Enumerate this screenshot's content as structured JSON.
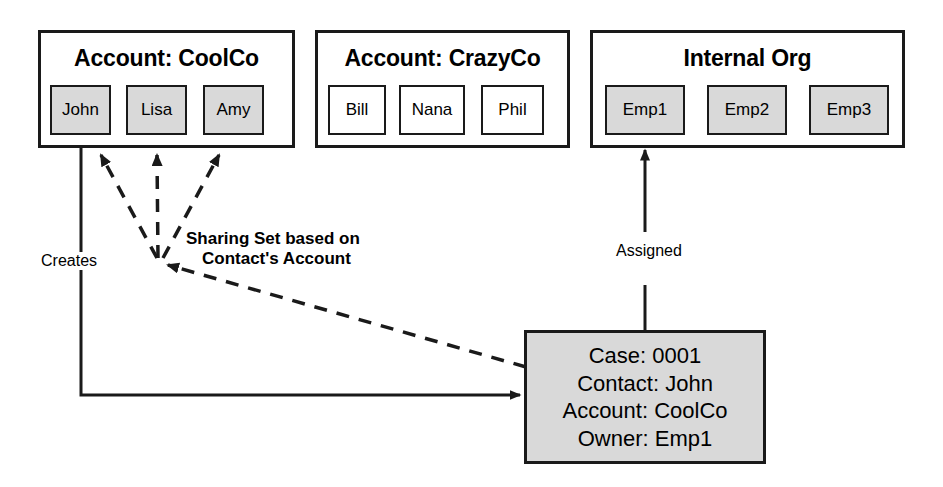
{
  "diagram": {
    "title": "Sharing Set based on Contact's Account",
    "groups": [
      {
        "id": "coolco",
        "title": "Account: CoolCo",
        "members": [
          {
            "label": "John",
            "fill": "filled"
          },
          {
            "label": "Lisa",
            "fill": "filled"
          },
          {
            "label": "Amy",
            "fill": "filled"
          }
        ]
      },
      {
        "id": "crazyco",
        "title": "Account: CrazyCo",
        "members": [
          {
            "label": "Bill",
            "fill": "plain"
          },
          {
            "label": "Nana",
            "fill": "plain"
          },
          {
            "label": "Phil",
            "fill": "plain"
          }
        ]
      },
      {
        "id": "internal-org",
        "title": "Internal Org",
        "members": [
          {
            "label": "Emp1",
            "fill": "filled"
          },
          {
            "label": "Emp2",
            "fill": "filled"
          },
          {
            "label": "Emp3",
            "fill": "filled"
          }
        ]
      }
    ],
    "record": {
      "name": "case-record",
      "lines": [
        "Case: 0001",
        "Contact: John",
        "Account: CoolCo",
        "Owner: Emp1"
      ]
    },
    "edges": [
      {
        "id": "creates",
        "label": "Creates",
        "style": "solid",
        "from": "John",
        "to": "Case: 0001"
      },
      {
        "id": "assigned",
        "label": "Assigned",
        "style": "solid",
        "from": "Case: 0001",
        "to": "Emp1"
      },
      {
        "id": "sharing-set",
        "label_line1": "Sharing Set based on",
        "label_line2": "Contact's Account",
        "style": "dashed",
        "from": "Case: 0001",
        "to": [
          "John",
          "Lisa",
          "Amy"
        ]
      }
    ],
    "colors": {
      "stroke": "#1a1a1a",
      "fill_gray": "#d9d9d9",
      "fill_white": "#ffffff",
      "background": "#ffffff"
    }
  }
}
